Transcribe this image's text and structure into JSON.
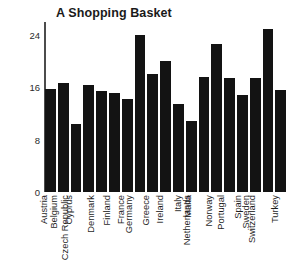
{
  "chart_data": {
    "type": "bar",
    "title": "A Shopping Basket",
    "xlabel": "",
    "ylabel": "",
    "ylim": [
      0,
      26
    ],
    "yticks": [
      0,
      8,
      16,
      24
    ],
    "grid": false,
    "legend": "none",
    "bar_color": "#131313",
    "axis_color": "#4c4c4c",
    "categories": [
      "Austria",
      "Belgium",
      "Cyprus",
      "Czech Republic",
      "Denmark",
      "Finland",
      "France",
      "Germany",
      "Greece",
      "Ireland",
      "Italy",
      "Malta",
      "Netherlands",
      "Norway",
      "Portugal",
      "Spain",
      "Sweden",
      "Switzerland",
      "Turkey"
    ],
    "values": [
      15.8,
      16.6,
      10.4,
      16.4,
      15.4,
      15.2,
      14.2,
      24.0,
      18.0,
      20.0,
      13.4,
      10.8,
      17.6,
      22.6,
      17.4,
      14.8,
      17.4,
      25.0,
      15.6
    ]
  },
  "axis": {
    "y_unit_label": ""
  }
}
